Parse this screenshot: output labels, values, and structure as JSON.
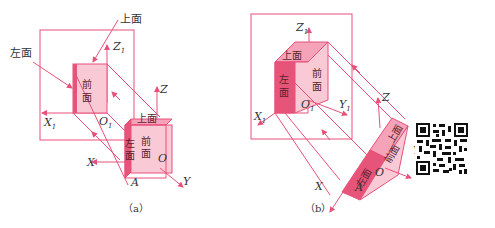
{
  "colors": {
    "line": "#e8507a",
    "face_light": "#f9c9d6",
    "face_mid": "#f4a3b8",
    "face_dark": "#e6547a",
    "text": "#333333"
  },
  "figure_a": {
    "caption": "（a）",
    "callouts": {
      "top": "上面",
      "left": "左面"
    },
    "projection_face": [
      "前",
      "面"
    ],
    "cube_faces": {
      "top": "上面",
      "left": [
        "左",
        "面"
      ],
      "front": [
        "前",
        "面"
      ]
    },
    "axes": {
      "Z1": "Z",
      "Z1_sub": "1",
      "X1": "X",
      "X1_sub": "1",
      "O1": "O",
      "O1_sub": "1",
      "Z": "Z",
      "X": "X",
      "Y": "Y",
      "O": "O",
      "A": "A"
    }
  },
  "figure_b": {
    "caption": "（b）",
    "cube_faces": {
      "top": "上面",
      "left": [
        "左",
        "面"
      ],
      "front": [
        "前",
        "面"
      ]
    },
    "rotated_faces": {
      "top": "上面",
      "left": "左面",
      "front": "前面"
    },
    "axes": {
      "Z1": "Z",
      "Z1_sub": "1",
      "X1": "X",
      "X1_sub": "1",
      "Y1": "Y",
      "Y1_sub": "1",
      "O1": "O",
      "O1_sub": "1",
      "Z": "Z",
      "X": "X",
      "Y": "Y",
      "O": "O",
      "A": "A"
    }
  },
  "qr_code": {
    "label": "qr-code"
  }
}
